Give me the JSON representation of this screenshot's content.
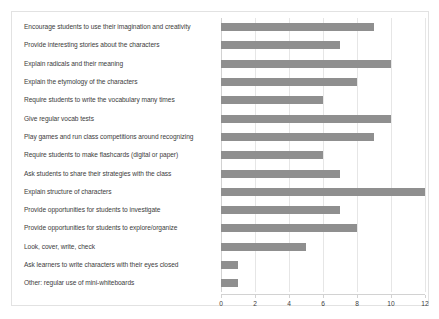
{
  "chart_data": {
    "type": "bar",
    "orientation": "horizontal",
    "title": "",
    "xlabel": "",
    "ylabel": "",
    "xlim": [
      0,
      12
    ],
    "xticks": [
      0,
      2,
      4,
      6,
      8,
      10,
      12
    ],
    "xtick_labels": [
      "0",
      "2",
      "4",
      "6",
      "8",
      "10",
      "12"
    ],
    "grid": true,
    "legend": false,
    "bar_color": "#8f8f8f",
    "categories": [
      "Encourage students to use their imagination and creativity",
      "Provide interesting stories about the characters",
      "Explain radicals and their meaning",
      "Explain the etymology of the characters",
      "Require students to write the vocabulary many times",
      "Give regular vocab tests",
      "Play games and run class competitions around recognizing",
      "Require students to make flashcards (digital or paper)",
      "Ask students to share their strategies with the class",
      "Explain structure of characters",
      "Provide opportunities for students to investigate",
      "Provide opportunities for students to explore/organize",
      "Look, cover, write, check",
      "Ask learners to write characters with their eyes closed",
      "Other: regular use of mini-whiteboards"
    ],
    "values": [
      9,
      7,
      10,
      8,
      6,
      10,
      9,
      6,
      7,
      12,
      7,
      8,
      5,
      1,
      1
    ]
  }
}
